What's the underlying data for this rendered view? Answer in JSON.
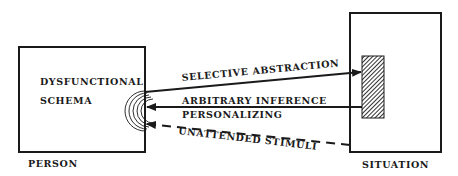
{
  "diagram": {
    "person": {
      "inner_line1": "DYSFUNCTIONAL",
      "inner_line2": "SCHEMA",
      "caption": "PERSON"
    },
    "situation": {
      "caption": "SITUATION"
    },
    "arrows": {
      "selective": "SELECTIVE ABSTRACTION",
      "arbitrary": "ARBITRARY INFERENCE",
      "personalizing": "PERSONALIZING",
      "unattended": "UNATTENDED STIMULI"
    },
    "colors": {
      "ink": "#1a1a1a",
      "background": "#ffffff"
    }
  }
}
